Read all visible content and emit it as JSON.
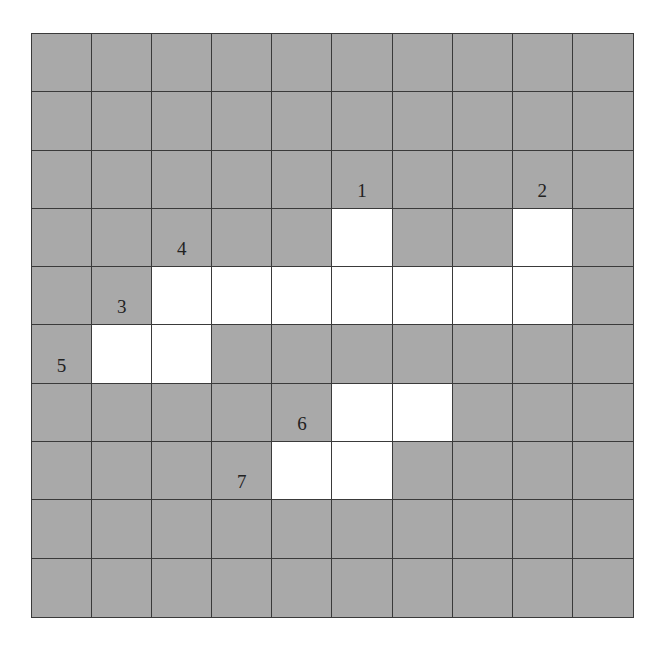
{
  "puzzle": {
    "rows": 10,
    "cols": 10,
    "colors": {
      "blocked": "#a9a9a9",
      "open": "#ffffff",
      "grid_line": "#3a3a3a",
      "number": "#222222"
    },
    "open_cells": [
      [
        3,
        5
      ],
      [
        3,
        8
      ],
      [
        4,
        2
      ],
      [
        4,
        3
      ],
      [
        4,
        4
      ],
      [
        4,
        5
      ],
      [
        4,
        6
      ],
      [
        4,
        7
      ],
      [
        4,
        8
      ],
      [
        5,
        1
      ],
      [
        5,
        2
      ],
      [
        6,
        5
      ],
      [
        6,
        6
      ],
      [
        7,
        4
      ],
      [
        7,
        5
      ]
    ],
    "labels": [
      {
        "row": 2,
        "col": 5,
        "text": "1"
      },
      {
        "row": 2,
        "col": 8,
        "text": "2"
      },
      {
        "row": 3,
        "col": 2,
        "text": "4"
      },
      {
        "row": 4,
        "col": 1,
        "text": "3"
      },
      {
        "row": 5,
        "col": 0,
        "text": "5"
      },
      {
        "row": 6,
        "col": 4,
        "text": "6"
      },
      {
        "row": 7,
        "col": 3,
        "text": "7"
      }
    ]
  }
}
